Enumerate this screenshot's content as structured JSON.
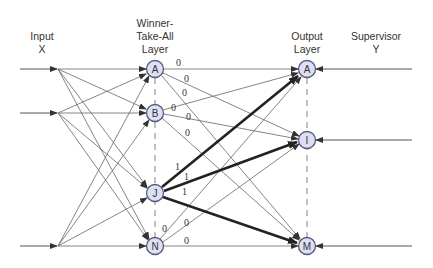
{
  "headers": {
    "input": [
      "Input",
      "X"
    ],
    "wta": [
      "Winner-",
      "Take-All",
      "Layer"
    ],
    "output": [
      "Output",
      "Layer"
    ],
    "supervisor": [
      "Supervisor",
      "Y"
    ]
  },
  "wta_nodes": [
    {
      "id": "A",
      "label": "A"
    },
    {
      "id": "B",
      "label": "B"
    },
    {
      "id": "J",
      "label": "J"
    },
    {
      "id": "N",
      "label": "N"
    }
  ],
  "output_nodes": [
    {
      "id": "A",
      "label": "A"
    },
    {
      "id": "I",
      "label": "I"
    },
    {
      "id": "M",
      "label": "M"
    }
  ],
  "weights": {
    "A_A": "0",
    "A_I": "0",
    "A_M": "0",
    "B_A": "0",
    "B_I": "0",
    "B_M": "0",
    "J_A": "1",
    "J_I": "1",
    "J_M": "1",
    "N_A": "0",
    "N_I": "0",
    "N_M": "0"
  },
  "colors": {
    "node_fill": "#dde0f3",
    "node_stroke": "#555a7a",
    "line": "#555555",
    "bold_line": "#222222"
  }
}
